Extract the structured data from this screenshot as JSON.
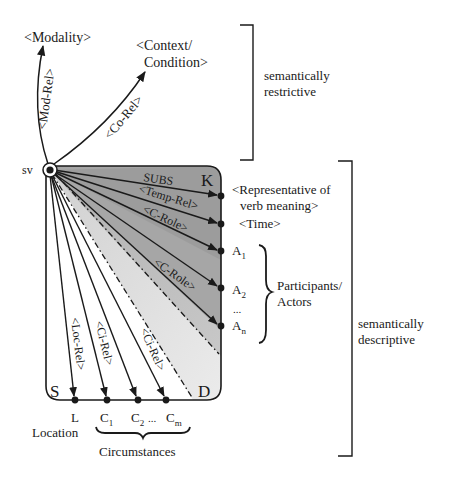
{
  "diagram": {
    "root_node": "sv",
    "top_targets": {
      "modality": "<Modality>",
      "context_line1": "<Context/",
      "context_line2": "Condition>"
    },
    "top_relations": {
      "mod_rel": "<Mod-Rel>",
      "co_rel": "<Co-Rel>"
    },
    "box_corners": {
      "K": "K",
      "S": "S",
      "D": "D"
    },
    "right_relations": {
      "subs": "SUBS",
      "temp_rel": "<Temp-Rel>",
      "c_role_1": "<C-Role>",
      "c_role_2": "<C-Role>"
    },
    "right_targets": {
      "rep_line1": "<Representative of",
      "rep_line2": "verb meaning>",
      "time": "<Time>",
      "a1": "A",
      "a1_sub": "1",
      "a2": "A",
      "a2_sub": "2",
      "ellipsis": "...",
      "an": "A",
      "an_sub": "n"
    },
    "participants_label_line1": "Participants/",
    "participants_label_line2": "Actors",
    "bottom_relations": {
      "loc_rel": "<Loc-Rel>",
      "ci_rel_1": "<Ci-Rel>",
      "ci_rel_2": "<Ci-Rel>"
    },
    "bottom_targets": {
      "l": "L",
      "c1": "C",
      "c1_sub": "1",
      "c2": "C",
      "c2_sub": "2",
      "dots": "...",
      "cm": "C",
      "cm_sub": "m"
    },
    "location_label": "Location",
    "circumstances_label": "Circumstances",
    "brackets": {
      "restrictive_line1": "semantically",
      "restrictive_line2": "restrictive",
      "descriptive_line1": "semantically",
      "descriptive_line2": "descriptive"
    },
    "colors": {
      "ink": "#1a1a1a",
      "shade_dark": "#a8a8a8",
      "shade_mid": "#c4c4c4",
      "shade_light": "#e2e2e2"
    }
  }
}
